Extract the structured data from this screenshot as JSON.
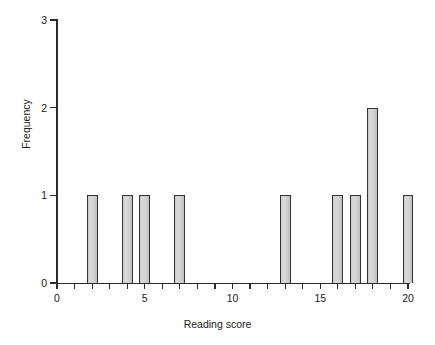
{
  "chart_data": {
    "type": "bar",
    "title": "",
    "xlabel": "Reading score",
    "ylabel": "Frequency",
    "xlim": [
      0,
      20
    ],
    "ylim": [
      0,
      3
    ],
    "grid": false,
    "legend": null,
    "x_tick_labels": [
      "0",
      "5",
      "10",
      "15",
      "20"
    ],
    "x_tick_values": [
      0,
      5,
      10,
      15,
      20
    ],
    "x_minor_tick_step": 1,
    "y_tick_labels": [
      "0",
      "1",
      "2",
      "3"
    ],
    "y_tick_values": [
      0,
      1,
      2,
      3
    ],
    "bar_width_units": 0.62,
    "categories": [
      2,
      4,
      5,
      7,
      13,
      16,
      17,
      18,
      20
    ],
    "values": [
      1,
      1,
      1,
      1,
      1,
      1,
      1,
      2,
      1
    ],
    "bars": [
      {
        "x": 2,
        "frequency": 1
      },
      {
        "x": 4,
        "frequency": 1
      },
      {
        "x": 5,
        "frequency": 1
      },
      {
        "x": 7,
        "frequency": 1
      },
      {
        "x": 13,
        "frequency": 1
      },
      {
        "x": 16,
        "frequency": 1
      },
      {
        "x": 17,
        "frequency": 1
      },
      {
        "x": 18,
        "frequency": 2
      },
      {
        "x": 20,
        "frequency": 1
      }
    ],
    "colors": {
      "bar_fill": "#d4d4d4",
      "bar_border": "#333333",
      "axis": "#2b2b2b",
      "text": "#1a1a1a",
      "background": "#ffffff"
    }
  }
}
